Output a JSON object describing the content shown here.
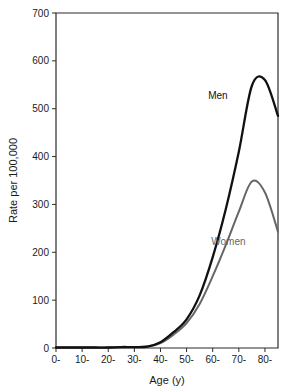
{
  "chart_data": {
    "type": "line",
    "title": "",
    "xlabel": "Age (y)",
    "ylabel": "Rate per 100,000",
    "x": [
      0,
      10,
      20,
      30,
      40,
      50,
      60,
      70,
      80
    ],
    "categories": [
      "0-",
      "10-",
      "20-",
      "30-",
      "40-",
      "50-",
      "60-",
      "70-",
      "80-"
    ],
    "xlim": [
      0,
      85
    ],
    "ylim": [
      0,
      700
    ],
    "yticks": [
      0,
      100,
      200,
      300,
      400,
      500,
      600,
      700
    ],
    "ytick_labels": [
      "0",
      "100",
      "200",
      "300",
      "400",
      "500",
      "600",
      "700"
    ],
    "grid": false,
    "legend_position": "inline-annotation",
    "series": [
      {
        "name": "Men",
        "color": "#111111",
        "x": [
          0,
          5,
          10,
          15,
          20,
          25,
          30,
          35,
          40,
          45,
          50,
          55,
          60,
          65,
          70,
          75,
          80,
          85
        ],
        "values": [
          1,
          1,
          1,
          1,
          1,
          2,
          2,
          3,
          12,
          33,
          60,
          110,
          190,
          290,
          410,
          548,
          560,
          485
        ]
      },
      {
        "name": "Women",
        "color": "#666666",
        "x": [
          0,
          5,
          10,
          15,
          20,
          25,
          30,
          35,
          40,
          45,
          50,
          55,
          60,
          65,
          70,
          75,
          80,
          85
        ],
        "values": [
          1,
          1,
          1,
          1,
          1,
          2,
          2,
          3,
          10,
          28,
          52,
          92,
          150,
          215,
          285,
          348,
          325,
          243
        ]
      }
    ],
    "annotations": [
      {
        "text": "Men",
        "series": "Men",
        "x": 62,
        "y": 520
      },
      {
        "text": "Women",
        "series": "Women",
        "x": 66,
        "y": 215
      }
    ]
  }
}
